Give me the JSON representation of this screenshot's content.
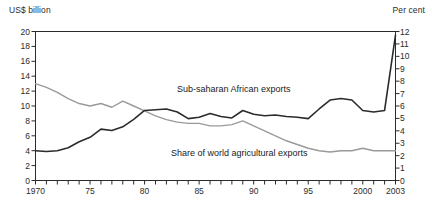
{
  "axis_captions": {
    "left": "US$ billion",
    "right": "Per cent"
  },
  "series_labels": {
    "exports": "Sub-saharan African exports",
    "share": "Share of world agricultural exports"
  },
  "chart_data": {
    "type": "line",
    "title": "",
    "xlabel": "",
    "ylabel": "US$ billion",
    "ylabel_right": "Per cent",
    "grid": false,
    "legend": "inline-annotations",
    "x": [
      1970,
      1971,
      1972,
      1973,
      1974,
      1975,
      1976,
      1977,
      1978,
      1979,
      1980,
      1981,
      1982,
      1983,
      1984,
      1985,
      1986,
      1987,
      1988,
      1989,
      1990,
      1991,
      1992,
      1993,
      1994,
      1995,
      1996,
      1997,
      1998,
      1999,
      2000,
      2001,
      2002,
      2003
    ],
    "xlim": [
      1970,
      2003
    ],
    "xticks": [
      1970,
      1975,
      1980,
      1985,
      1990,
      1995,
      2000,
      2003
    ],
    "xticklabels": [
      "1970",
      "75",
      "80",
      "85",
      "90",
      "95",
      "2000",
      "2003"
    ],
    "ylim": [
      0,
      20
    ],
    "yticks": [
      0,
      2,
      4,
      6,
      8,
      10,
      12,
      14,
      16,
      18,
      20
    ],
    "yticklabels": [
      "0",
      "2",
      "4",
      "6",
      "8",
      "10",
      "12",
      "14",
      "16",
      "18",
      "20"
    ],
    "ylim_right": [
      0,
      12
    ],
    "yticks_right": [
      0,
      1,
      2,
      3,
      4,
      5,
      6,
      7,
      8,
      9,
      10,
      11,
      12
    ],
    "yticklabels_right": [
      "0",
      "1",
      "2",
      "3",
      "4",
      "5",
      "6",
      "7",
      "8",
      "9",
      "10",
      "11",
      "12"
    ],
    "series": [
      {
        "name": "Sub-saharan African exports",
        "axis": "left",
        "units": "US$ billion",
        "color": "#2b2b2b",
        "values": [
          4.0,
          3.9,
          4.0,
          4.4,
          5.2,
          5.8,
          6.9,
          6.7,
          7.2,
          8.2,
          9.4,
          9.5,
          9.6,
          9.2,
          8.3,
          8.5,
          9.0,
          8.6,
          8.4,
          9.4,
          8.9,
          8.7,
          8.8,
          8.6,
          8.5,
          8.3,
          9.6,
          10.8,
          11.0,
          10.8,
          9.4,
          9.2,
          9.4,
          19.5
        ]
      },
      {
        "name": "Share of world agricultural exports",
        "axis": "right",
        "units": "per cent",
        "color": "#9a9a9a",
        "values": [
          7.8,
          7.5,
          7.1,
          6.6,
          6.2,
          6.0,
          6.2,
          5.9,
          6.4,
          6.0,
          5.6,
          5.2,
          4.9,
          4.7,
          4.6,
          4.6,
          4.4,
          4.4,
          4.5,
          4.8,
          4.4,
          4.0,
          3.6,
          3.2,
          2.9,
          2.6,
          2.4,
          2.3,
          2.4,
          2.4,
          2.6,
          2.4,
          2.4,
          2.4
        ]
      }
    ]
  }
}
